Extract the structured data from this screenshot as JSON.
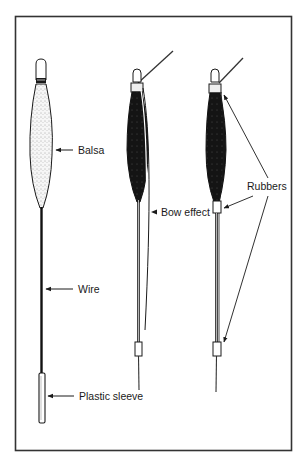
{
  "figure": {
    "colors": {
      "ink": "#1a1a1a",
      "frame": "#333333",
      "balsa_fill": "#f4f4f4",
      "body_dark": "#141414",
      "background": "#ffffff"
    }
  },
  "labels": {
    "balsa": "Balsa",
    "wire": "Wire",
    "plastic_sleeve": "Plastic sleeve",
    "bow_effect": "Bow effect",
    "rubbers": "Rubbers"
  },
  "floats": [
    {
      "id": "float-1",
      "type": "balsa-wire",
      "parts": [
        "tip",
        "balsa body",
        "wire stem",
        "plastic sleeve"
      ]
    },
    {
      "id": "float-2",
      "type": "dark-body-bow",
      "parts": [
        "tip",
        "top rubber",
        "line",
        "dark body",
        "stem",
        "bottom rubber"
      ]
    },
    {
      "id": "float-3",
      "type": "dark-body-rubbers",
      "parts": [
        "tip",
        "top rubber",
        "line",
        "dark body",
        "middle rubber",
        "stem",
        "bottom rubber"
      ]
    }
  ]
}
